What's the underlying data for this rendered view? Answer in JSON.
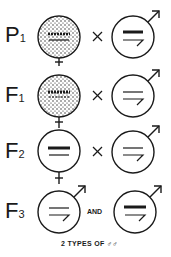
{
  "diagram": {
    "type": "genetic-cross",
    "rows": [
      {
        "generation": "P",
        "sub": "1",
        "female": {
          "shaded": true,
          "bars": [
            "thick-dashed",
            "thin"
          ]
        },
        "operator": "×",
        "male": {
          "bars": [
            "thick",
            "bent"
          ]
        }
      },
      {
        "generation": "F",
        "sub": "1",
        "female": {
          "shaded": true,
          "bars": [
            "thick-dashed",
            "thin-dashed"
          ]
        },
        "operator": "×",
        "male": {
          "bars": [
            "thin",
            "bent"
          ]
        }
      },
      {
        "generation": "F",
        "sub": "2",
        "female": {
          "shaded": false,
          "bars": [
            "thick",
            "thin"
          ]
        },
        "operator": "×",
        "male": {
          "bars": [
            "thin",
            "bent"
          ]
        }
      },
      {
        "generation": "F",
        "sub": "3",
        "male_a": {
          "bars": [
            "thin",
            "bent"
          ]
        },
        "operator": "AND",
        "male_b": {
          "bars": [
            "thick",
            "bent"
          ]
        }
      }
    ],
    "caption": "2 TYPES OF ♂♂"
  },
  "labels": {
    "row1_gen": "P",
    "row1_sub": "1",
    "row2_gen": "F",
    "row2_sub": "1",
    "row3_gen": "F",
    "row3_sub": "2",
    "row4_gen": "F",
    "row4_sub": "3",
    "cross": "×",
    "and": "AND",
    "caption": "2 TYPES OF ♂♂"
  },
  "colors": {
    "ink": "#1a1a1a",
    "background": "#ffffff"
  }
}
